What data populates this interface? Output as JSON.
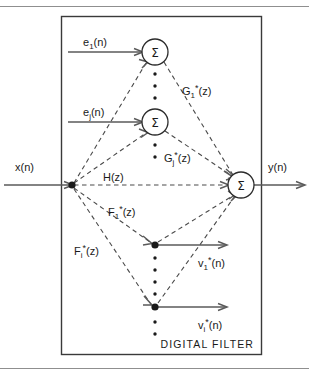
{
  "figure": {
    "caption": "DIGITAL FILTER",
    "colors": {
      "line_solid": "#5a5a5a",
      "line_dashed": "#4a4a4a",
      "frame": "#3a3a3a",
      "rule": "#8f8f8f",
      "text": "#1a1a1a",
      "background": "#ffffff"
    },
    "signals": {
      "input": {
        "name": "x",
        "arg": "(n)",
        "label": "x(n)"
      },
      "output": {
        "name": "y",
        "arg": "(n)",
        "label": "y(n)"
      },
      "errors": [
        {
          "base": "e",
          "sub": "1",
          "arg": "(n)",
          "label": "e1(n)"
        },
        {
          "base": "e",
          "sub": "j",
          "arg": "(n)",
          "label": "ej(n)"
        }
      ],
      "outputs_v": [
        {
          "base": "v",
          "sub": "1",
          "sup": "*",
          "arg": "(n)",
          "label": "v1*(n)"
        },
        {
          "base": "v",
          "sub": "i",
          "sup": "*",
          "arg": "(n)",
          "label": "vi*(n)"
        }
      ]
    },
    "transfer_functions": {
      "main": {
        "base": "H",
        "arg": "(z)",
        "label": "H(z)"
      },
      "forward": [
        {
          "base": "G",
          "sub": "1",
          "sup": "*",
          "arg": "(z)",
          "label": "G1*(z)"
        },
        {
          "base": "G",
          "sub": "j",
          "sup": "*",
          "arg": "(z)",
          "label": "Gj*(z)"
        }
      ],
      "feedback": [
        {
          "base": "F",
          "sub": "1",
          "sup": "*",
          "arg": "(z)",
          "label": "F1*(z)"
        },
        {
          "base": "F",
          "sub": "i",
          "sup": "*",
          "arg": "(z)",
          "label": "Fi*(z)"
        }
      ]
    },
    "summers": [
      {
        "id": "summer-top",
        "glyph": "Σ",
        "cx": 155,
        "cy": 52
      },
      {
        "id": "summer-middle",
        "glyph": "Σ",
        "cx": 155,
        "cy": 122
      },
      {
        "id": "summer-output",
        "glyph": "Σ",
        "cx": 241,
        "cy": 185
      }
    ],
    "nodes": [
      {
        "id": "branch-input",
        "cx": 72,
        "cy": 185
      },
      {
        "id": "tap-node-1",
        "cx": 155,
        "cy": 245
      },
      {
        "id": "tap-node-i",
        "cx": 155,
        "cy": 307
      }
    ]
  }
}
